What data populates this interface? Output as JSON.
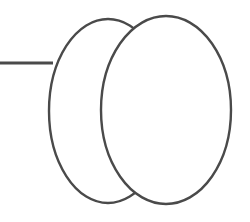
{
  "canvas": {
    "width": 250,
    "height": 222,
    "background_color": "#ffffff"
  },
  "style": {
    "stroke_color": "#4a4a4a",
    "shape_fill": "#ffffff",
    "shape_stroke_width": 2.4,
    "connector_stroke_width": 3.0
  },
  "diagram": {
    "shapes": [
      {
        "id": "ellipse-left",
        "name": "left-ellipse",
        "type": "ellipse",
        "cx": 108,
        "cy": 111,
        "rx": 59,
        "ry": 92,
        "fill": "#ffffff",
        "stroke": "#4a4a4a",
        "stroke_width": 2.4,
        "z": 1,
        "label": ""
      },
      {
        "id": "ellipse-right",
        "name": "right-ellipse",
        "type": "ellipse",
        "cx": 166,
        "cy": 110,
        "rx": 65,
        "ry": 94,
        "fill": "#ffffff",
        "stroke": "#4a4a4a",
        "stroke_width": 2.4,
        "z": 2,
        "label": ""
      }
    ],
    "connectors": [
      {
        "id": "connector-left",
        "name": "left-connector-line",
        "type": "line",
        "x1": 0,
        "y1": 63,
        "x2": 53,
        "y2": 63,
        "stroke": "#4a4a4a",
        "stroke_width": 3.0,
        "attaches_to": "ellipse-left",
        "label": ""
      }
    ]
  }
}
